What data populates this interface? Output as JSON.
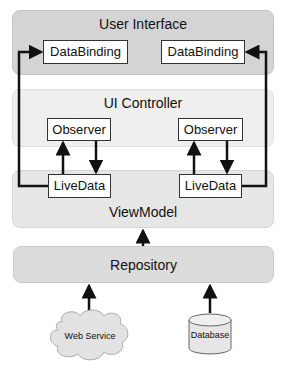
{
  "layers": {
    "user_interface": {
      "title": "User Interface",
      "color": "#d4d4d4"
    },
    "ui_controller": {
      "title": "UI Controller",
      "color": "#efefef"
    },
    "viewmodel": {
      "title": "ViewModel",
      "color": "#e6e6e6"
    },
    "repository": {
      "title": "Repository",
      "color": "#dcdcdc"
    }
  },
  "boxes": {
    "databinding_left": "DataBinding",
    "databinding_right": "DataBinding",
    "observer_left": "Observer",
    "observer_right": "Observer",
    "livedata_left": "LiveData",
    "livedata_right": "LiveData"
  },
  "sources": {
    "web_service": "Web Service",
    "database": "Database"
  }
}
